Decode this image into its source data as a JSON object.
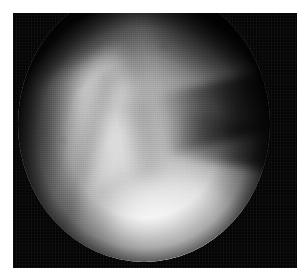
{
  "page": {
    "width": 301,
    "height": 275,
    "background_color": "#ffffff",
    "caption": ""
  },
  "radiograph": {
    "modality_appearance": "fluoroscopy",
    "colorspace": "grayscale",
    "frame": {
      "x": 13,
      "y": 13,
      "width": 284,
      "height": 255,
      "background_color": "#050505"
    },
    "field_of_view": {
      "shape": "circle",
      "cropped_edge": "top",
      "center_x": 144,
      "center_y": 112,
      "radius": 126,
      "rim_color": "#0b0b0b"
    },
    "tone": {
      "black": "#050505",
      "shadow": "#1d1d1d",
      "midtone": "#7e7e7e",
      "light": "#c9c9c9",
      "highlight": "#ffffff"
    },
    "features": [
      {
        "name": "superior-haze",
        "label": "faint soft-tissue haze above field of view",
        "tone": "shadow"
      },
      {
        "name": "superomedial-dark",
        "label": "dark upper-left falloff",
        "tone": "black"
      },
      {
        "name": "superolateral-dark",
        "label": "dark upper-right corner block",
        "tone": "black"
      },
      {
        "name": "bright-knob",
        "label": "bright rounded condyle-like density, centre-left",
        "tone": "light"
      },
      {
        "name": "oblique-bright-band",
        "label": "bright oblique bone edge, upper-left to centre",
        "tone": "light"
      },
      {
        "name": "lucency-band-1",
        "label": "dark oblique lucency descending to lower-left",
        "tone": "shadow"
      },
      {
        "name": "lucency-band-2",
        "label": "dark oblique lucency descending from centre-top",
        "tone": "shadow"
      },
      {
        "name": "lateral-wedge",
        "label": "dark wedge notch entering from the right",
        "tone": "black"
      },
      {
        "name": "lateral-wedge-2",
        "label": "second dark wedge entering from lower right",
        "tone": "black"
      },
      {
        "name": "tissue-plateau",
        "label": "broad bright soft-tissue plateau, mid-left",
        "tone": "midtone"
      },
      {
        "name": "inferior-blush",
        "label": "brilliant near-white inferolateral blush",
        "tone": "highlight"
      },
      {
        "name": "inferior-blush-2",
        "label": "bright inferior blush along lower arc",
        "tone": "highlight"
      }
    ],
    "texture": {
      "grain": "fine horizontal scan-line grid",
      "mottle": "blotchy quantisation noise"
    }
  }
}
